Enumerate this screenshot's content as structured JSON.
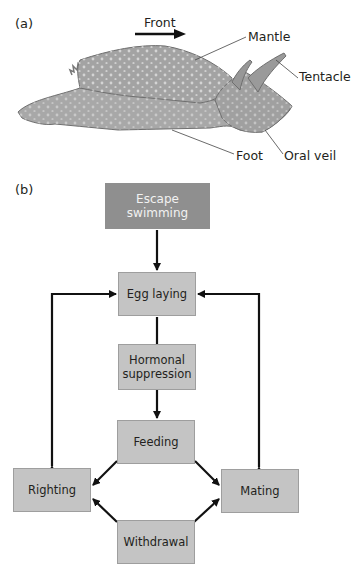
{
  "panel_a": {
    "label": "(a)",
    "direction_label": "Front",
    "callouts": {
      "mantle": "Mantle",
      "tentacle": "Tentacle",
      "foot": "Foot",
      "oral_veil": "Oral veil"
    }
  },
  "panel_b": {
    "label": "(b)",
    "nodes": {
      "escape_swimming": "Escape swimming",
      "egg_laying": "Egg laying",
      "hormonal_suppression_1": "Hormonal",
      "hormonal_suppression_2": "suppression",
      "feeding": "Feeding",
      "righting": "Righting",
      "mating": "Mating",
      "withdrawal": "Withdrawal"
    },
    "edges": [
      {
        "from": "Escape swimming",
        "to": "Egg laying",
        "type": "inhibits"
      },
      {
        "from": "Egg laying",
        "to": "Hormonal suppression",
        "type": "line"
      },
      {
        "from": "Hormonal suppression",
        "to": "Feeding",
        "type": "inhibits"
      },
      {
        "from": "Righting",
        "to": "Egg laying",
        "type": "mutual"
      },
      {
        "from": "Mating",
        "to": "Egg laying",
        "type": "mutual"
      },
      {
        "from": "Feeding",
        "to": "Righting",
        "type": "inhibits"
      },
      {
        "from": "Feeding",
        "to": "Mating",
        "type": "inhibits"
      },
      {
        "from": "Withdrawal",
        "to": "Righting",
        "type": "inhibits"
      },
      {
        "from": "Withdrawal",
        "to": "Mating",
        "type": "inhibits"
      }
    ]
  },
  "colors": {
    "box_fill": "#c4c4c4",
    "dark_box_fill": "#8f8f8f",
    "body_fill": "#a9a9a9",
    "arrow": "#111111"
  }
}
